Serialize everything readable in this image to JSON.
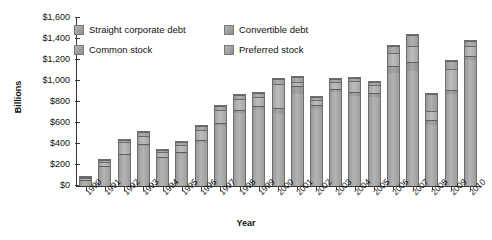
{
  "chart_data": {
    "type": "bar",
    "stacked": true,
    "title": "",
    "xlabel": "Year",
    "ylabel": "Billions",
    "ylim": [
      0,
      1600
    ],
    "ytick_labels": [
      "$0",
      "$200",
      "$400",
      "$600",
      "$800",
      "$1,000",
      "$1,200",
      "$1,400",
      "$1,600"
    ],
    "ytick_values": [
      0,
      200,
      400,
      600,
      800,
      1000,
      1200,
      1400,
      1600
    ],
    "grid": false,
    "legend_position": "top-inside",
    "categories": [
      "1990",
      "1991",
      "1992",
      "1993",
      "1994",
      "1995",
      "1996",
      "1997",
      "1998",
      "1999",
      "2000",
      "2001",
      "2002",
      "2003",
      "2004",
      "2005",
      "2006",
      "2007",
      "2008",
      "2009",
      "2010"
    ],
    "series": [
      {
        "name": "Straight corporate debt",
        "values": [
          60,
          190,
          300,
          390,
          270,
          310,
          420,
          580,
          700,
          740,
          690,
          880,
          740,
          900,
          870,
          860,
          1080,
          1100,
          590,
          880,
          1210
        ]
      },
      {
        "name": "Convertible debt",
        "values": [
          5,
          10,
          15,
          20,
          15,
          20,
          25,
          30,
          30,
          30,
          60,
          80,
          45,
          35,
          35,
          35,
          70,
          90,
          50,
          40,
          40
        ]
      },
      {
        "name": "Preferred stock",
        "values": [
          5,
          15,
          25,
          35,
          20,
          25,
          35,
          40,
          40,
          40,
          50,
          50,
          35,
          30,
          30,
          30,
          60,
          110,
          170,
          80,
          45
        ]
      },
      {
        "name": "Common stock",
        "values": [
          30,
          40,
          110,
          80,
          45,
          70,
          100,
          120,
          110,
          90,
          230,
          40,
          40,
          65,
          105,
          75,
          130,
          150,
          80,
          200,
          95
        ]
      }
    ],
    "totals": [
      100,
      255,
      450,
      525,
      350,
      425,
      580,
      770,
      880,
      900,
      1030,
      1050,
      860,
      1030,
      1040,
      1000,
      1340,
      1450,
      890,
      1200,
      1390
    ]
  },
  "legend": {
    "items": [
      {
        "label": "Straight corporate debt"
      },
      {
        "label": "Convertible debt"
      },
      {
        "label": "Common stock"
      },
      {
        "label": "Preferred stock"
      }
    ]
  },
  "colors": {
    "axis": "#3a3a3a",
    "text": "#111111",
    "bar_light": "#b4b4b4",
    "bar_mid": "#a3a3a3",
    "bar_dark": "#8e8e8e",
    "bar_edge": "#6e6e6e",
    "background": "#ffffff"
  }
}
